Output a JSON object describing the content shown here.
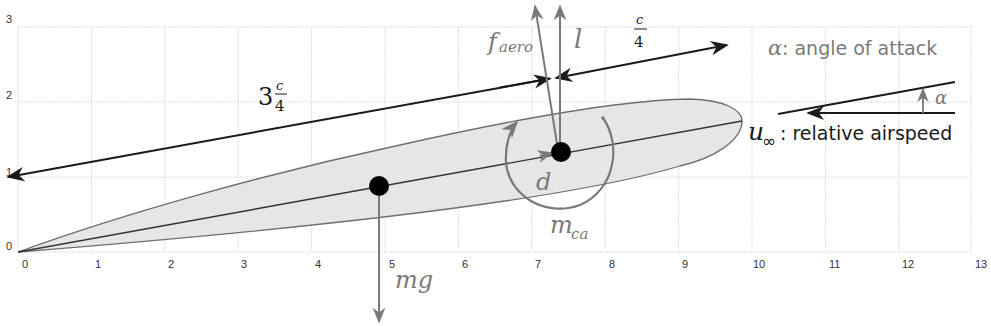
{
  "figure": {
    "type": "airfoil free-body diagram",
    "axes": {
      "x_ticks": [
        "0",
        "1",
        "2",
        "3",
        "4",
        "5",
        "6",
        "7",
        "8",
        "9",
        "10",
        "11",
        "12",
        "13"
      ],
      "y_ticks": [
        "0",
        "1",
        "2",
        "3"
      ],
      "xlim": [
        0,
        13
      ],
      "ylim": [
        0,
        3
      ],
      "grid": true
    },
    "labels": {
      "three_quarter_chord_whole": "3",
      "three_quarter_chord_num": "c",
      "three_quarter_chord_den": "4",
      "quarter_chord_num": "c",
      "quarter_chord_den": "4",
      "f_aero_main": "f",
      "f_aero_sub": "aero",
      "lift": "l",
      "drag": "d",
      "moment_main": "m",
      "moment_sub": "ca",
      "weight": "mg",
      "alpha_symbol": "α",
      "alpha_desc": ": angle of attack",
      "alpha_inset": "α",
      "airspeed_main": "u",
      "airspeed_sub": "∞",
      "airspeed_desc": ": relative airspeed"
    },
    "points": {
      "center_of_gravity": {
        "x": 4.9,
        "y": 0.88
      },
      "aerodynamic_center": {
        "x": 7.4,
        "y": 1.33
      },
      "trailing_edge": {
        "x": 0,
        "y": 0
      },
      "leading_edge": {
        "x": 9.85,
        "y": 1.75
      }
    },
    "colors": {
      "grid": "#dcdcdc",
      "airfoil_fill": "#e6e6e6",
      "airfoil_stroke": "#6e6e6e",
      "force_arrows": "#7a7a7a",
      "dimension_lines": "#1a1a1a",
      "dots": "#000000"
    }
  }
}
